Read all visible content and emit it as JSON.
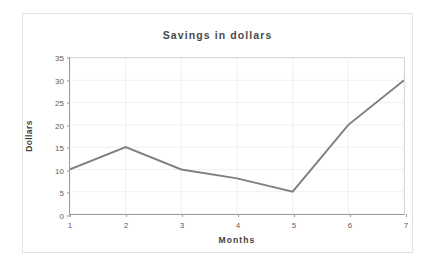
{
  "chart_data": {
    "type": "line",
    "title": "Savings in dollars",
    "xlabel": "Months",
    "ylabel": "Dollars",
    "x": [
      1,
      2,
      3,
      4,
      5,
      6,
      7
    ],
    "categories": [
      "1",
      "2",
      "3",
      "4",
      "5",
      "6",
      "7"
    ],
    "values": [
      10,
      15,
      10,
      8,
      5,
      20,
      30
    ],
    "series": [
      {
        "name": "Savings",
        "values": [
          10,
          15,
          10,
          8,
          5,
          20,
          30
        ]
      }
    ],
    "xlim": [
      1,
      7
    ],
    "ylim": [
      0,
      35
    ],
    "y_ticks": [
      0,
      5,
      10,
      15,
      20,
      25,
      30,
      35
    ],
    "y_tick_labels": [
      "0",
      "5",
      "10",
      "15",
      "20",
      "25",
      "30",
      "35"
    ],
    "x_ticks": [
      1,
      2,
      3,
      4,
      5,
      6,
      7
    ],
    "x_tick_labels": [
      "1",
      "2",
      "3",
      "4",
      "5",
      "6",
      "7"
    ],
    "grid": true,
    "legend": false,
    "legend_position": "none",
    "markers": false,
    "line_color": "#808080",
    "line_width": 2,
    "grid_color": "#f0f0f0",
    "axis_color": "#9a9a9a",
    "text_color": "#4a4a4a",
    "background_color": "#ffffff",
    "border_color": "#e2e2e2"
  }
}
